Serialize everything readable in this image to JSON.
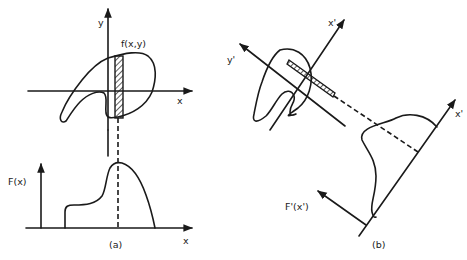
{
  "panel_a": {
    "caption": "(a)",
    "top_plot": {
      "x_axis_label": "x",
      "y_axis_label": "y",
      "function_label": "f(x,y)",
      "description": "Closed 2D contour of f(x,y) with a hatched vertical integration strip parallel to the y-axis"
    },
    "bottom_plot": {
      "x_axis_label": "x",
      "y_axis_label": "F(x)",
      "description": "Projection F(x) obtained by integrating f(x,y) along y; dashed line connects strip to projection value"
    }
  },
  "panel_b": {
    "caption": "(b)",
    "rotated_axes": {
      "x_axis_label": "x'",
      "y_axis_label": "y'",
      "description": "Same contour with rotated axes x', y' and a hatched strip parallel to y'"
    },
    "projection": {
      "x_axis_label": "x'",
      "y_axis_label": "F'(x')",
      "description": "Projection F'(x') along rotated direction; dashed line links strip to projection"
    }
  },
  "colors": {
    "ink": "#1a1a1a",
    "background": "#ffffff"
  }
}
